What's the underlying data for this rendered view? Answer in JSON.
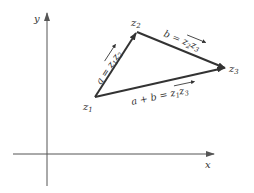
{
  "axes": {
    "x_label": "x",
    "y_label": "y"
  },
  "points": {
    "z1": {
      "label_base": "z",
      "label_sub": "1"
    },
    "z2": {
      "label_base": "z",
      "label_sub": "2"
    },
    "z3": {
      "label_base": "z",
      "label_sub": "3"
    }
  },
  "vectors": {
    "a": {
      "name": "a",
      "eq": " = ",
      "from": "z",
      "from_sub": "1",
      "to": "z",
      "to_sub": "2"
    },
    "b": {
      "name": "b",
      "eq": " = ",
      "from": "z",
      "from_sub": "2",
      "to": "z",
      "to_sub": "3"
    },
    "sum": {
      "name": "a + b",
      "eq": " = ",
      "from": "z",
      "from_sub": "1",
      "to": "z",
      "to_sub": "3"
    }
  },
  "colors": {
    "axis": "#555555",
    "vector": "#333333",
    "text": "#333333"
  }
}
